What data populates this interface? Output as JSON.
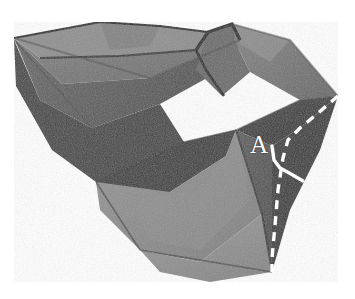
{
  "figure": {
    "kind": "photograph",
    "rendering": "grayscale halftone photo on white background",
    "background_color": "#ffffff",
    "width": 355,
    "height": 299
  },
  "annotations": {
    "point_label": {
      "text": "A",
      "color": "#ffffff",
      "x": 250,
      "y": 132,
      "font_size": 25,
      "style": "serif capital"
    },
    "dashed_fold_line": {
      "name": "valley-fold-guide",
      "color": "#fdfdfd",
      "style": "dashed",
      "stroke_width": 3.4,
      "dash_pattern": "9 7",
      "points": [
        [
          338,
          96
        ],
        [
          317,
          114
        ],
        [
          300,
          128
        ],
        [
          288,
          140
        ],
        [
          283,
          158
        ],
        [
          278,
          190
        ],
        [
          275,
          225
        ],
        [
          272,
          258
        ],
        [
          272,
          272
        ]
      ]
    },
    "solid_marker_line": {
      "name": "reference-edge-marker",
      "color": "#fdfdfd",
      "style": "solid",
      "stroke_width": 3.4,
      "points": [
        [
          272,
          146
        ],
        [
          274,
          160
        ],
        [
          280,
          168
        ],
        [
          291,
          174
        ],
        [
          303,
          181
        ]
      ]
    }
  },
  "palette": {
    "paper_light": "#9a9a9a",
    "paper_mid": "#8b8b8b",
    "paper_midlow": "#7c7c7c",
    "paper_dark": "#5c5c5c",
    "paper_darker": "#4a4a4a",
    "paper_darkest": "#3a3a3a",
    "crease_shadow": "#242424",
    "highlight_white": "#fdfdfd",
    "background": "#ffffff"
  },
  "facets": [
    {
      "name": "top-left-upper-flap",
      "tone": "#8f8f8f",
      "points": "14,38 100,22 160,26 208,32 196,50 120,56 40,58"
    },
    {
      "name": "top-left-band",
      "tone": "#777777",
      "points": "14,38 40,58 120,56 196,50 208,32 232,24 240,40 150,78 62,84"
    },
    {
      "name": "left-long-wedge",
      "tone": "#5a5a5a",
      "points": "14,38 62,84 150,78 240,40 236,62 160,104 92,128 40,100"
    },
    {
      "name": "left-lower-dark",
      "tone": "#464646",
      "points": "14,40 40,100 92,128 160,104 184,142 96,182 52,150 16,86"
    },
    {
      "name": "center-dark-wedge",
      "tone": "#3e3e3e",
      "points": "96,182 184,142 236,130 226,156 170,192 118,204"
    },
    {
      "name": "lower-left-mid",
      "tone": "#8d8d8d",
      "points": "96,182 170,192 226,156 236,130 262,214 200,262 140,250 100,210"
    },
    {
      "name": "bottom-center-panel",
      "tone": "#939393",
      "points": "140,250 200,262 262,214 272,272 210,282 160,272"
    },
    {
      "name": "right-upper-flap",
      "tone": "#7a7a7a",
      "points": "232,24 290,40 338,96 300,100 250,72 236,44"
    },
    {
      "name": "right-flap-inner",
      "tone": "#6b6b6b",
      "points": "208,32 232,24 236,44 250,72 222,96 196,70"
    },
    {
      "name": "right-dark-triangle",
      "tone": "#3c3c3c",
      "points": "236,130 300,100 338,96 300,128 272,146"
    },
    {
      "name": "right-lower-face",
      "tone": "#565656",
      "points": "236,130 272,146 272,272 262,214"
    }
  ],
  "creases": [
    {
      "name": "flap-outline-shadow",
      "tone": "#242424",
      "path": "M 196,50 L 208,32 L 232,24 L 240,40"
    },
    {
      "name": "top-edge-crease",
      "tone": "#242424",
      "path": "M 14,38 L 100,22 L 160,26 L 208,32"
    },
    {
      "name": "long-diagonal-crease",
      "tone": "#242424",
      "path": "M 14,38 L 150,78 L 240,40"
    },
    {
      "name": "center-convergence-crease",
      "tone": "#242424",
      "path": "M 96,182 L 236,130"
    },
    {
      "name": "lower-right-ridge",
      "tone": "#242424",
      "path": "M 236,130 L 262,214 L 272,272"
    },
    {
      "name": "bottom-left-edge",
      "tone": "#242424",
      "path": "M 96,182 L 140,250 L 272,272"
    }
  ]
}
